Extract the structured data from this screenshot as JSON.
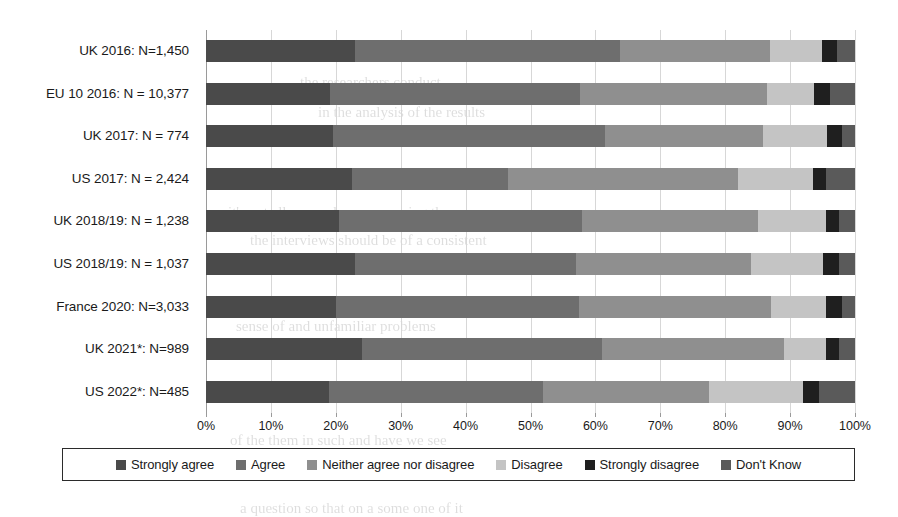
{
  "chart_data": {
    "type": "bar",
    "subtype": "stacked-horizontal-100pct",
    "title": "",
    "xlabel": "",
    "ylabel": "",
    "xlim": [
      0,
      100
    ],
    "xticks": [
      "0%",
      "10%",
      "20%",
      "30%",
      "40%",
      "50%",
      "60%",
      "70%",
      "80%",
      "90%",
      "100%"
    ],
    "grid": true,
    "legend_position": "bottom",
    "categories": [
      "UK 2016: N=1,450",
      "EU 10 2016: N = 10,377",
      "UK 2017: N = 774",
      "US 2017: N = 2,424",
      "UK 2018/19: N = 1,238",
      "US 2018/19: N = 1,037",
      "France 2020: N=3,033",
      "UK 2021*: N=989",
      "US 2022*: N=485"
    ],
    "series": [
      {
        "name": "Strongly agree",
        "color": "#4a4a4a",
        "values": [
          23.0,
          19.1,
          20.0,
          22.5,
          20.5,
          23.0,
          20.0,
          24.0,
          19.0
        ]
      },
      {
        "name": "Agree",
        "color": "#6e6e6e",
        "values": [
          40.8,
          38.5,
          43.0,
          24.0,
          37.5,
          34.0,
          37.5,
          37.0,
          33.0
        ]
      },
      {
        "name": "Neither agree nor disagree",
        "color": "#8f8f8f",
        "values": [
          23.1,
          28.9,
          25.0,
          35.5,
          27.0,
          27.0,
          29.5,
          28.0,
          25.5
        ]
      },
      {
        "name": "Disagree",
        "color": "#c4c4c4",
        "values": [
          8.0,
          7.2,
          10.0,
          11.5,
          10.5,
          11.0,
          8.5,
          6.5,
          14.5
        ]
      },
      {
        "name": "Strongly disagree",
        "color": "#1f1f1f",
        "values": [
          2.3,
          2.5,
          2.5,
          2.0,
          2.0,
          2.5,
          2.5,
          2.0,
          2.5
        ]
      },
      {
        "name": "Don't Know",
        "color": "#5a5a5a",
        "values": [
          2.8,
          3.8,
          2.0,
          4.5,
          2.5,
          2.5,
          2.0,
          2.5,
          5.5
        ]
      }
    ]
  },
  "legend": {
    "items": [
      {
        "label": "Strongly agree",
        "color": "#4a4a4a"
      },
      {
        "label": "Agree",
        "color": "#6e6e6e"
      },
      {
        "label": "Neither agree nor disagree",
        "color": "#8f8f8f"
      },
      {
        "label": "Disagree",
        "color": "#c4c4c4"
      },
      {
        "label": "Strongly disagree",
        "color": "#1f1f1f"
      },
      {
        "label": "Don't Know",
        "color": "#5a5a5a"
      }
    ]
  },
  "background_text": {
    "lines": [
      {
        "text": "the researchers conduct",
        "x": 300,
        "y": 74,
        "size": 15
      },
      {
        "text": "in the analysis of the results",
        "x": 318,
        "y": 104,
        "size": 15
      },
      {
        "text": "it's not all so much or concerning the measure",
        "x": 228,
        "y": 204,
        "size": 15
      },
      {
        "text": "the interviews should be of a consistent",
        "x": 250,
        "y": 232,
        "size": 15
      },
      {
        "text": "sense of and unfamiliar problems",
        "x": 236,
        "y": 318,
        "size": 15
      },
      {
        "text": "the that it was an extensive view at standards exist",
        "x": 225,
        "y": 346,
        "size": 15
      },
      {
        "text": "of the them in such and have we see",
        "x": 230,
        "y": 432,
        "size": 15
      },
      {
        "text": "a question so that on a some one of it",
        "x": 240,
        "y": 500,
        "size": 15
      }
    ]
  }
}
